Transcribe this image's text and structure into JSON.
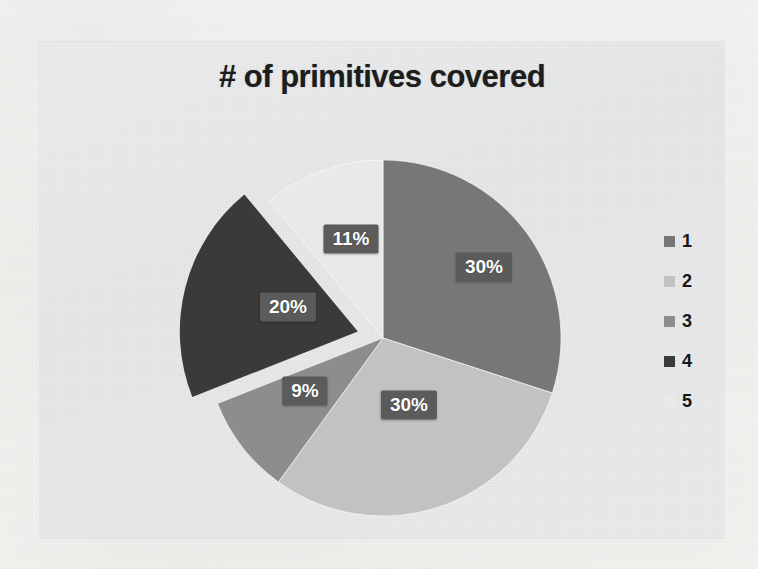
{
  "chart_data": {
    "type": "pie",
    "title": "# of primitives covered",
    "categories": [
      "1",
      "2",
      "3",
      "4",
      "5"
    ],
    "values": [
      30,
      30,
      9,
      20,
      11
    ],
    "value_labels": [
      "30%",
      "30%",
      "9%",
      "20%",
      "11%"
    ],
    "colors": [
      "#777777",
      "#c2c2c2",
      "#8d8d8d",
      "#3a3a3a",
      "#e9e9e9"
    ],
    "legend_position": "right",
    "legend_entries": [
      "1",
      "2",
      "3",
      "4",
      "5"
    ],
    "start_angle_deg": 0,
    "direction": "clockwise",
    "exploded_slice_index": 3,
    "grid": false,
    "xlabel": "",
    "ylabel": ""
  },
  "labels": [
    {
      "text": "30%",
      "x": 484,
      "y": 267
    },
    {
      "text": "30%",
      "x": 409,
      "y": 405
    },
    {
      "text": "9%",
      "x": 305,
      "y": 391
    },
    {
      "text": "20%",
      "x": 288,
      "y": 307
    },
    {
      "text": "11%",
      "x": 351,
      "y": 239
    }
  ]
}
